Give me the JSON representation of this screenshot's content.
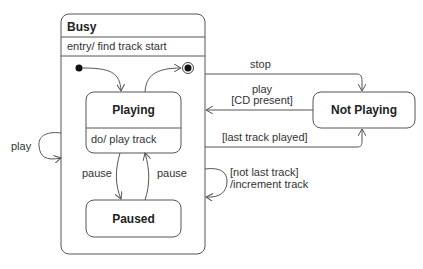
{
  "diagram": {
    "type": "UML state machine",
    "composite_state": {
      "name": "Busy",
      "entry_action": "entry/ find track start",
      "substates": [
        {
          "name": "Playing",
          "activity": "do/ play track"
        },
        {
          "name": "Paused"
        }
      ]
    },
    "external_state": {
      "name": "Not Playing"
    },
    "transitions": [
      {
        "from": "initial",
        "to": "Playing",
        "label": ""
      },
      {
        "from": "Playing",
        "to": "final",
        "label": ""
      },
      {
        "from": "Playing",
        "to": "Paused",
        "label": "pause"
      },
      {
        "from": "Paused",
        "to": "Playing",
        "label": "pause"
      },
      {
        "from": "Busy",
        "to": "Busy",
        "label": "play"
      },
      {
        "from": "Busy",
        "to": "Not Playing",
        "label": "stop"
      },
      {
        "from": "Not Playing",
        "to": "Busy",
        "label_line1": "play",
        "label_line2": "[CD present]"
      },
      {
        "from": "Busy",
        "to": "Not Playing",
        "label": "[last track played]"
      },
      {
        "from": "Busy",
        "to": "Busy",
        "label_line1": "[not last track]",
        "label_line2": "/increment track"
      }
    ]
  }
}
